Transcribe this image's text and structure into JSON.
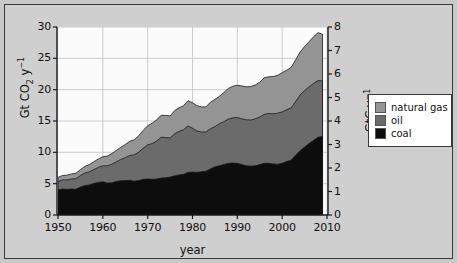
{
  "figure": {
    "background_color": "#c9c9c9",
    "frame_color": "#3a3a3a",
    "plot_background": "#fbfbfb"
  },
  "chart_data": {
    "type": "area",
    "title": "",
    "subtitle": "",
    "xlabel": "year",
    "ylabel": "Gt CO2 y-1",
    "ylabel_secondary": "GtC y-1",
    "xlim": [
      1950,
      2010
    ],
    "ylim": [
      0,
      30
    ],
    "ylim_secondary": [
      0,
      8
    ],
    "grid": true,
    "stacked": true,
    "legend_position": "right",
    "xticks": [
      1950,
      1960,
      1970,
      1980,
      1990,
      2000,
      2010
    ],
    "xticklabels": [
      "1950",
      "1960",
      "1970",
      "1980",
      "1990",
      "2000",
      "2010"
    ],
    "yticks": [
      0,
      5,
      10,
      15,
      20,
      25,
      30
    ],
    "yticklabels": [
      "0",
      "5",
      "10",
      "15",
      "20",
      "25",
      "30"
    ],
    "yticks_secondary": [
      0,
      1,
      2,
      3,
      4,
      5,
      6,
      7,
      8
    ],
    "yticklabels_secondary": [
      "0",
      "1",
      "2",
      "3",
      "4",
      "5",
      "6",
      "7",
      "8"
    ],
    "units_note": "Left axis Gt CO2 per year; right axis GtC per year; conversion factor 3.664",
    "x": [
      1950,
      1951,
      1952,
      1953,
      1954,
      1955,
      1956,
      1957,
      1958,
      1959,
      1960,
      1961,
      1962,
      1963,
      1964,
      1965,
      1966,
      1967,
      1968,
      1969,
      1970,
      1971,
      1972,
      1973,
      1974,
      1975,
      1976,
      1977,
      1978,
      1979,
      1980,
      1981,
      1982,
      1983,
      1984,
      1985,
      1986,
      1987,
      1988,
      1989,
      1990,
      1991,
      1992,
      1993,
      1994,
      1995,
      1996,
      1997,
      1998,
      1999,
      2000,
      2001,
      2002,
      2003,
      2004,
      2005,
      2006,
      2007,
      2008,
      2009
    ],
    "series": [
      {
        "name": "coal",
        "color": "#0d0d0d",
        "values": [
          4.0,
          4.15,
          4.1,
          4.15,
          4.1,
          4.45,
          4.7,
          4.8,
          5.05,
          5.2,
          5.3,
          5.1,
          5.15,
          5.35,
          5.45,
          5.5,
          5.55,
          5.4,
          5.5,
          5.7,
          5.75,
          5.7,
          5.75,
          5.9,
          5.95,
          6.05,
          6.25,
          6.4,
          6.5,
          6.8,
          6.85,
          6.8,
          6.9,
          7.0,
          7.35,
          7.7,
          7.85,
          8.05,
          8.25,
          8.3,
          8.25,
          8.05,
          7.85,
          7.8,
          7.85,
          8.05,
          8.25,
          8.25,
          8.15,
          8.1,
          8.25,
          8.55,
          8.75,
          9.55,
          10.25,
          10.85,
          11.4,
          11.9,
          12.4,
          12.55
        ]
      },
      {
        "name": "oil",
        "color": "#6b6b6b",
        "values": [
          1.35,
          1.45,
          1.5,
          1.6,
          1.7,
          1.85,
          2.0,
          2.1,
          2.2,
          2.4,
          2.55,
          2.75,
          2.95,
          3.15,
          3.4,
          3.65,
          3.95,
          4.2,
          4.55,
          4.95,
          5.45,
          5.7,
          6.05,
          6.5,
          6.4,
          6.25,
          6.7,
          6.95,
          7.1,
          7.4,
          7.0,
          6.6,
          6.35,
          6.25,
          6.4,
          6.4,
          6.7,
          6.85,
          7.05,
          7.2,
          7.3,
          7.3,
          7.35,
          7.35,
          7.5,
          7.6,
          7.8,
          7.95,
          8.0,
          8.15,
          8.2,
          8.25,
          8.35,
          8.55,
          8.9,
          9.0,
          9.05,
          9.1,
          9.05,
          8.85
        ]
      },
      {
        "name": "natural gas",
        "color": "#949494",
        "values": [
          0.65,
          0.7,
          0.75,
          0.8,
          0.85,
          0.95,
          1.05,
          1.15,
          1.25,
          1.35,
          1.45,
          1.55,
          1.7,
          1.8,
          1.95,
          2.1,
          2.25,
          2.4,
          2.6,
          2.85,
          3.05,
          3.25,
          3.4,
          3.5,
          3.55,
          3.5,
          3.7,
          3.75,
          3.85,
          4.05,
          4.05,
          4.05,
          4.0,
          4.0,
          4.25,
          4.35,
          4.4,
          4.65,
          4.9,
          5.05,
          5.15,
          5.25,
          5.25,
          5.35,
          5.4,
          5.55,
          5.85,
          5.85,
          5.95,
          6.05,
          6.25,
          6.3,
          6.45,
          6.65,
          6.85,
          7.05,
          7.2,
          7.45,
          7.65,
          7.45
        ]
      }
    ],
    "peak_total_gt_co2": 29.3,
    "peak_year": 2008,
    "start_total_gt_co2": 6.0
  },
  "legend": {
    "items": [
      {
        "label": "natural gas",
        "color": "#949494"
      },
      {
        "label": "oil",
        "color": "#6b6b6b"
      },
      {
        "label": "coal",
        "color": "#0d0d0d"
      }
    ]
  },
  "axis_titles": {
    "left_prefix": "Gt CO",
    "left_sub": "2",
    "left_mid": " y",
    "left_sup": "−1",
    "right_prefix": "GtC y",
    "right_sup": "−1",
    "x": "year"
  }
}
